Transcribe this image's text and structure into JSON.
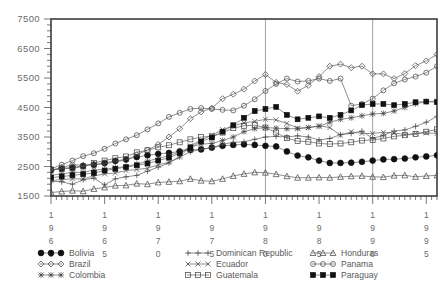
{
  "chart_data": {
    "type": "line",
    "title": "",
    "subtitle": "",
    "xlabel": "",
    "ylabel": "",
    "grid": false,
    "legend_position": "bottom",
    "legend_columns": 3,
    "xlim": [
      1960,
      1996
    ],
    "ylim": [
      1500,
      7500
    ],
    "yticks": [
      1500,
      2500,
      3500,
      4500,
      5500,
      6500,
      7500
    ],
    "ytick_labels": [
      "1500",
      "2500",
      "3500",
      "4500",
      "5500",
      "6500",
      "7500"
    ],
    "xticks": [
      1960,
      1965,
      1970,
      1975,
      1980,
      1985,
      1990,
      1995
    ],
    "xtick_labels": [
      "1960",
      "1965",
      "1970",
      "1975",
      "1980",
      "1985",
      "1990",
      "1995"
    ],
    "xtick_orientation": "vertical-stacked-digits",
    "minor_ticks": true,
    "annotations": [
      {
        "type": "vertical-line",
        "x": 1980
      },
      {
        "type": "vertical-line",
        "x": 1990
      }
    ],
    "x": [
      1960,
      1961,
      1962,
      1963,
      1964,
      1965,
      1966,
      1967,
      1968,
      1969,
      1970,
      1971,
      1972,
      1973,
      1974,
      1975,
      1976,
      1977,
      1978,
      1979,
      1980,
      1981,
      1982,
      1983,
      1984,
      1985,
      1986,
      1987,
      1988,
      1989,
      1990,
      1991,
      1992,
      1993,
      1994,
      1995,
      1996
    ],
    "series": [
      {
        "name": "Bolivia",
        "marker": "filled-circle",
        "values": [
          2380,
          2430,
          2470,
          2520,
          2560,
          2620,
          2690,
          2740,
          2820,
          2880,
          2930,
          2960,
          3010,
          3060,
          3080,
          3140,
          3200,
          3230,
          3250,
          3230,
          3200,
          3180,
          3010,
          2870,
          2810,
          2700,
          2620,
          2620,
          2630,
          2660,
          2700,
          2740,
          2750,
          2770,
          2810,
          2840,
          2880
        ]
      },
      {
        "name": "Dominican Republic",
        "marker": "plus",
        "values": [
          2000,
          1980,
          1900,
          2050,
          2100,
          1880,
          2080,
          2150,
          2200,
          2340,
          2480,
          2620,
          2820,
          3000,
          3080,
          3140,
          3250,
          3320,
          3340,
          3420,
          3500,
          3520,
          3500,
          3540,
          3500,
          3400,
          3450,
          3580,
          3620,
          3700,
          3450,
          3560,
          3700,
          3740,
          3860,
          4000,
          4200
        ]
      },
      {
        "name": "Honduras",
        "marker": "triangle",
        "values": [
          1620,
          1650,
          1680,
          1660,
          1740,
          1790,
          1850,
          1860,
          1920,
          1900,
          1960,
          1980,
          2000,
          2080,
          2020,
          2000,
          2080,
          2180,
          2250,
          2300,
          2290,
          2240,
          2170,
          2120,
          2120,
          2130,
          2120,
          2150,
          2170,
          2180,
          2150,
          2140,
          2190,
          2200,
          2150,
          2180,
          2200
        ]
      },
      {
        "name": "Brazil",
        "marker": "diamond",
        "values": [
          2370,
          2460,
          2560,
          2540,
          2580,
          2580,
          2660,
          2720,
          2900,
          3060,
          3250,
          3500,
          3780,
          4120,
          4350,
          4480,
          4800,
          4950,
          5120,
          5400,
          5620,
          5350,
          5280,
          5050,
          5250,
          5550,
          5900,
          5970,
          5850,
          5900,
          5640,
          5640,
          5480,
          5650,
          5920,
          6080,
          6300
        ]
      },
      {
        "name": "Ecuador",
        "marker": "x-cross",
        "values": [
          2020,
          2060,
          2080,
          2080,
          2180,
          2250,
          2280,
          2360,
          2400,
          2440,
          2560,
          2640,
          2820,
          3200,
          3400,
          3560,
          3750,
          3880,
          3980,
          4030,
          4100,
          4080,
          3960,
          3800,
          3820,
          3880,
          3820,
          3560,
          3680,
          3620,
          3620,
          3660,
          3640,
          3580,
          3620,
          3640,
          3620
        ]
      },
      {
        "name": "Panama",
        "marker": "open-circle",
        "values": [
          2420,
          2560,
          2700,
          2850,
          2950,
          3100,
          3280,
          3420,
          3560,
          3760,
          3960,
          4180,
          4320,
          4450,
          4480,
          4450,
          4420,
          4400,
          4560,
          4780,
          5060,
          5300,
          5480,
          5380,
          5400,
          5480,
          5400,
          5480,
          4560,
          4620,
          4800,
          5080,
          5320,
          5450,
          5550,
          5680,
          5900
        ]
      },
      {
        "name": "Colombia",
        "marker": "asterisk",
        "values": [
          2200,
          2250,
          2300,
          2300,
          2380,
          2400,
          2460,
          2500,
          2580,
          2680,
          2780,
          2860,
          3000,
          3150,
          3260,
          3280,
          3380,
          3500,
          3680,
          3780,
          3820,
          3800,
          3780,
          3780,
          3820,
          3860,
          4000,
          4100,
          4150,
          4220,
          4280,
          4300,
          4380,
          4500,
          4620,
          4700,
          4720
        ]
      },
      {
        "name": "Guatemala",
        "marker": "open-square",
        "values": [
          2400,
          2420,
          2440,
          2500,
          2620,
          2700,
          2780,
          2840,
          2980,
          3050,
          3150,
          3220,
          3320,
          3420,
          3500,
          3520,
          3650,
          3800,
          3880,
          3900,
          3820,
          3650,
          3460,
          3360,
          3340,
          3280,
          3260,
          3280,
          3320,
          3380,
          3400,
          3450,
          3520,
          3560,
          3600,
          3680,
          3760
        ]
      },
      {
        "name": "Paraguay",
        "marker": "filled-square",
        "values": [
          2120,
          2160,
          2200,
          2240,
          2280,
          2360,
          2420,
          2480,
          2540,
          2600,
          2700,
          2800,
          2950,
          3150,
          3350,
          3480,
          3680,
          3900,
          4150,
          4380,
          4450,
          4520,
          4250,
          4100,
          4150,
          4200,
          4150,
          4250,
          4400,
          4580,
          4620,
          4620,
          4580,
          4620,
          4680,
          4700,
          4680
        ]
      }
    ]
  },
  "legend": {
    "entries": [
      {
        "label": "Bolivia",
        "marker": "filled-circle"
      },
      {
        "label": "Brazil",
        "marker": "diamond"
      },
      {
        "label": "Colombia",
        "marker": "asterisk"
      },
      {
        "label": "Dominican Republic",
        "marker": "plus"
      },
      {
        "label": "Ecuador",
        "marker": "x-cross"
      },
      {
        "label": "Guatemala",
        "marker": "open-square"
      },
      {
        "label": "Honduras",
        "marker": "triangle"
      },
      {
        "label": "Panama",
        "marker": "open-circle"
      },
      {
        "label": "Paraguay",
        "marker": "filled-square"
      }
    ]
  },
  "colors": {
    "frame": "#3c3c3c",
    "line": "#5e5e5e",
    "marker": "#3f3f3f",
    "marker_filled": "#111111",
    "text": "#5a5a5a",
    "vline": "#8c8c8c",
    "background": "#ffffff"
  }
}
